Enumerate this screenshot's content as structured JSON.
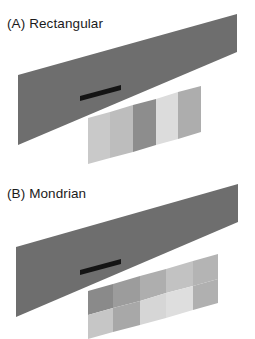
{
  "figure": {
    "background_color": "#ffffff",
    "width": 255,
    "height": 339
  },
  "panels": [
    {
      "id": "panel-a",
      "label": "(A) Rectangular",
      "band": {
        "name": "shadow-band",
        "color": "#6e6e6e",
        "points": "18,75 237,14 237,52 18,145"
      },
      "marker": {
        "name": "black-wedge-marker",
        "color": "#141414",
        "points": "80,96 121,85 121,90 80,101"
      },
      "patch_layout": "rectangular-stripes",
      "patches": [
        {
          "name": "stripe-1",
          "color": "#c9c9c9",
          "points": "88,118 110,112 110,158 88,164"
        },
        {
          "name": "stripe-2",
          "color": "#bdbdbd",
          "points": "110,112 133,105 133,152 110,158"
        },
        {
          "name": "stripe-3",
          "color": "#8d8d8d",
          "points": "133,105 156,99 156,145 133,152"
        },
        {
          "name": "stripe-4",
          "color": "#dcdcdc",
          "points": "156,99 178,92 178,139 156,145"
        },
        {
          "name": "stripe-5",
          "color": "#adadad",
          "points": "178,92 201,86 201,132 178,139"
        }
      ]
    },
    {
      "id": "panel-b",
      "label": "(B) Mondrian",
      "band": {
        "name": "shadow-band",
        "color": "#6e6e6e",
        "points": "16,77 238,14 238,52 16,147"
      },
      "marker": {
        "name": "black-wedge-marker",
        "color": "#141414",
        "points": "80,100 121,89 121,94 80,105"
      },
      "patch_layout": "mondrian-grid",
      "patches": [
        {
          "name": "mondrian-top-1",
          "color": "#8a8a8a",
          "points": "88,121 113,114 113,138 88,145"
        },
        {
          "name": "mondrian-top-2",
          "color": "#9c9c9c",
          "points": "113,114 140,106 140,131 113,138"
        },
        {
          "name": "mondrian-top-3",
          "color": "#aeaeae",
          "points": "140,106 166,99 166,123 140,131"
        },
        {
          "name": "mondrian-top-4",
          "color": "#c2c2c2",
          "points": "166,99 193,91 193,116 166,123"
        },
        {
          "name": "mondrian-top-5",
          "color": "#b4b4b4",
          "points": "193,91 218,84 218,109 193,116"
        },
        {
          "name": "mondrian-bottom-1",
          "color": "#c6c6c6",
          "points": "88,145 113,138 113,162 88,169"
        },
        {
          "name": "mondrian-bottom-2",
          "color": "#a8a8a8",
          "points": "113,138 140,131 140,155 113,162"
        },
        {
          "name": "mondrian-bottom-3",
          "color": "#d6d6d6",
          "points": "140,131 166,123 166,148 140,155"
        },
        {
          "name": "mondrian-bottom-4",
          "color": "#dedede",
          "points": "166,123 193,116 193,140 166,148"
        },
        {
          "name": "mondrian-bottom-5",
          "color": "#b0b0b0",
          "points": "193,116 218,109 218,133 193,140"
        }
      ]
    }
  ]
}
